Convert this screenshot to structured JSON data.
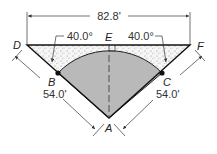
{
  "diagram": {
    "points": {
      "A": "A",
      "B": "B",
      "C": "C",
      "D": "D",
      "E": "E",
      "F": "F"
    },
    "dimensions": {
      "top_width": "82.8'",
      "left_side": "54.0'",
      "right_side": "54.0'",
      "left_angle": "40.0°",
      "right_angle": "40.0°"
    },
    "colors": {
      "sector_fill": "#b8b8b8",
      "hatch_fill": "#f4f4f4",
      "line": "#222222"
    }
  }
}
